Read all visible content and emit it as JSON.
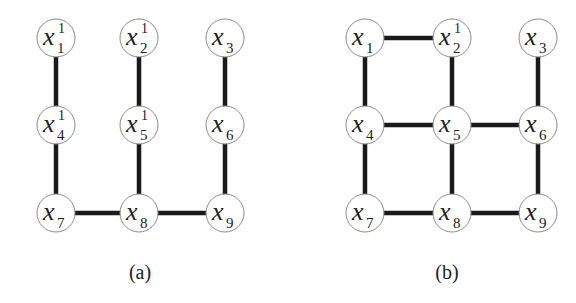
{
  "panels": [
    {
      "id": "a",
      "caption": "(a)",
      "nodes": [
        {
          "id": "1",
          "var": "x",
          "sub": "1",
          "sup": "1",
          "col": 0,
          "row": 0
        },
        {
          "id": "2",
          "var": "x",
          "sub": "2",
          "sup": "1",
          "col": 1,
          "row": 0
        },
        {
          "id": "3",
          "var": "x",
          "sub": "3",
          "sup": "",
          "col": 2,
          "row": 0
        },
        {
          "id": "4",
          "var": "x",
          "sub": "4",
          "sup": "1",
          "col": 0,
          "row": 1
        },
        {
          "id": "5",
          "var": "x",
          "sub": "5",
          "sup": "1",
          "col": 1,
          "row": 1
        },
        {
          "id": "6",
          "var": "x",
          "sub": "6",
          "sup": "",
          "col": 2,
          "row": 1
        },
        {
          "id": "7",
          "var": "x",
          "sub": "7",
          "sup": "",
          "col": 0,
          "row": 2
        },
        {
          "id": "8",
          "var": "x",
          "sub": "8",
          "sup": "",
          "col": 1,
          "row": 2
        },
        {
          "id": "9",
          "var": "x",
          "sub": "9",
          "sup": "",
          "col": 2,
          "row": 2
        }
      ],
      "edges": [
        [
          "1",
          "4"
        ],
        [
          "4",
          "7"
        ],
        [
          "2",
          "5"
        ],
        [
          "5",
          "8"
        ],
        [
          "3",
          "6"
        ],
        [
          "6",
          "9"
        ],
        [
          "7",
          "8"
        ],
        [
          "8",
          "9"
        ]
      ]
    },
    {
      "id": "b",
      "caption": "(b)",
      "nodes": [
        {
          "id": "1",
          "var": "x",
          "sub": "1",
          "sup": "",
          "col": 0,
          "row": 0
        },
        {
          "id": "2",
          "var": "x",
          "sub": "2",
          "sup": "1",
          "col": 1,
          "row": 0
        },
        {
          "id": "3",
          "var": "x",
          "sub": "3",
          "sup": "",
          "col": 2,
          "row": 0
        },
        {
          "id": "4",
          "var": "x",
          "sub": "4",
          "sup": "",
          "col": 0,
          "row": 1
        },
        {
          "id": "5",
          "var": "x",
          "sub": "5",
          "sup": "",
          "col": 1,
          "row": 1
        },
        {
          "id": "6",
          "var": "x",
          "sub": "6",
          "sup": "",
          "col": 2,
          "row": 1
        },
        {
          "id": "7",
          "var": "x",
          "sub": "7",
          "sup": "",
          "col": 0,
          "row": 2
        },
        {
          "id": "8",
          "var": "x",
          "sub": "8",
          "sup": "",
          "col": 1,
          "row": 2
        },
        {
          "id": "9",
          "var": "x",
          "sub": "9",
          "sup": "",
          "col": 2,
          "row": 2
        }
      ],
      "edges": [
        [
          "1",
          "2"
        ],
        [
          "1",
          "4"
        ],
        [
          "2",
          "5"
        ],
        [
          "3",
          "6"
        ],
        [
          "4",
          "5"
        ],
        [
          "5",
          "6"
        ],
        [
          "4",
          "7"
        ],
        [
          "5",
          "8"
        ],
        [
          "6",
          "9"
        ],
        [
          "7",
          "8"
        ],
        [
          "8",
          "9"
        ]
      ]
    }
  ],
  "layout": {
    "a": {
      "xs": [
        56,
        139,
        225
      ],
      "ys": [
        38,
        125,
        213
      ],
      "caption_x": 140
    },
    "b": {
      "xs": [
        365,
        452,
        538
      ],
      "ys": [
        38,
        125,
        213
      ],
      "caption_x": 447
    },
    "caption_y": 279,
    "node_radius": 19
  }
}
